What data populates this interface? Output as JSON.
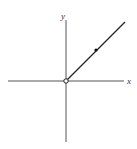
{
  "diagram": {
    "type": "function-graph",
    "axes": {
      "x_label": "x",
      "y_label": "y"
    },
    "ray": {
      "start": "origin",
      "start_marker": "open-circle",
      "direction": "up-right",
      "slope": 1
    },
    "points": [
      {
        "kind": "closed",
        "on": "ray"
      }
    ],
    "colors": {
      "axis": "#555555",
      "ray": "#222222"
    }
  }
}
